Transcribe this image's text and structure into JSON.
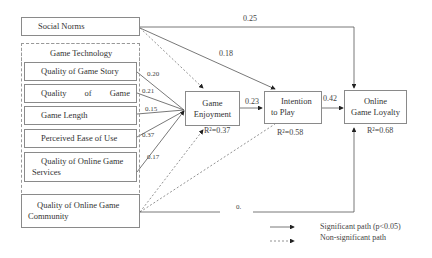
{
  "nodes": {
    "social_norms": "Social Norms",
    "group_title": "Game Technology",
    "game_story": "Quality of Game Story",
    "game_quality": [
      "Quality",
      "of",
      "Game"
    ],
    "game_length": "Game Length",
    "ease_of_use": "Perceived Ease of Use",
    "online_services_1": "Quality of Online Game",
    "online_services_2": "Services",
    "community_1": "Quality of Online Game",
    "community_2": "Community",
    "enjoyment_1": "Game",
    "enjoyment_2": "Enjoyment",
    "intention_1": "Intention",
    "intention_2": "to Play",
    "loyalty_1": "Online",
    "loyalty_2": "Game Loyalty"
  },
  "paths": {
    "social_loyalty": "0.25",
    "social_intention": "0.18",
    "story_enjoy": "0.20",
    "quality_enjoy": "0.21",
    "length_enjoy": "0.15",
    "ease_enjoy": "0.37",
    "services_enjoy": "0.17",
    "enjoy_intention": "0.23",
    "intention_loyalty": "0.42",
    "community_loyalty": "0."
  },
  "r2": {
    "enjoyment": "R²=0.37",
    "intention": "R²=0.58",
    "loyalty": "R²=0.68"
  },
  "legend": {
    "significant": "Significant path (p<0.05)",
    "non_significant": "Non-significant path"
  }
}
